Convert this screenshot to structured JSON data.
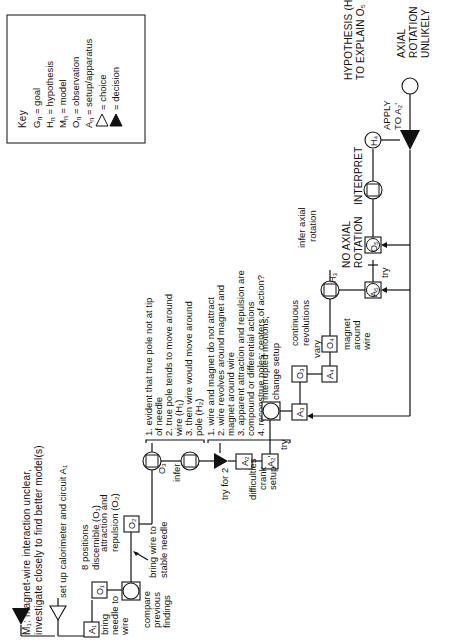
{
  "key": {
    "title": "Key",
    "entries": [
      {
        "symbol": "Gn",
        "meaning": "goal"
      },
      {
        "symbol": "Hn",
        "meaning": "hypothesis"
      },
      {
        "symbol": "Mn",
        "meaning": "model"
      },
      {
        "symbol": "On",
        "meaning": "observation"
      },
      {
        "symbol": "An",
        "meaning": "setup/apparatus"
      },
      {
        "symbol": "open-triangle",
        "meaning": "choice"
      },
      {
        "symbol": "filled-triangle",
        "meaning": "decision"
      }
    ],
    "eq": "="
  },
  "model": {
    "line1": "M₁: magnet-wire interaction unclear,",
    "line2": "investigate closely to find better model(s)"
  },
  "setup": {
    "text": "set up calorimeter and circuit A₁"
  },
  "nodes": {
    "A1": "A₁",
    "O1": "O₁",
    "O2": "O₂",
    "O3": "O₃",
    "A2": "A₂",
    "A2p": "A₂'",
    "A3": "A₃",
    "O3b": "O₃",
    "A4": "A₄",
    "O4": "O₄",
    "H3": "H₃",
    "A5": "A₅",
    "O5": "O₅",
    "H4": "H₄"
  },
  "labels": {
    "bring_needle": [
      "bring",
      "needle to",
      "wire"
    ],
    "compare": [
      "compare",
      "previous",
      "findings"
    ],
    "positions": [
      "8 positions",
      "discernible (O₁)"
    ],
    "attraction": [
      "attraction and",
      "repulsion (O₂)"
    ],
    "bring_wire": [
      "bring wire to",
      "stable needle"
    ],
    "infer": "infer",
    "try_for_2": "try for 2",
    "difficulties": "difficulties",
    "crank_setup": [
      "crank",
      "setup"
    ],
    "try1": "try",
    "interrupted": [
      "interrupted motions;",
      "change setup"
    ],
    "continuous": [
      "continuous",
      "revolutions"
    ],
    "vary": "vary",
    "magnet_around_wire": [
      "magnet",
      "around",
      "wire"
    ],
    "infer_axial": [
      "infer axial",
      "rotation"
    ],
    "no_axial": [
      "NO AXIAL",
      "ROTATION"
    ],
    "try2": "try",
    "interpret": "INTERPRET",
    "hypothesis": [
      "HYPOTHESIS (H₄)",
      "TO EXPLAIN O₅"
    ],
    "apply": [
      "APPLY",
      "TO A₂'"
    ],
    "axial_unlikely": [
      "AXIAL",
      "ROTATION",
      "UNLIKELY"
    ]
  },
  "list1": [
    "1. evident that true pole not at tip",
    "    of needle",
    "2. true pole tends to move around",
    "    wire (H₁)",
    "3. then wire would move around",
    "    pole (H₂)"
  ],
  "list2": [
    "1. wire and magnet do not attract",
    "2. wire revolves around magnet and",
    "    magnet around wire",
    "3. apparent attraction and repulsion are",
    "    compound or differential actions",
    "4. reconstrue poles; centers of action?"
  ]
}
